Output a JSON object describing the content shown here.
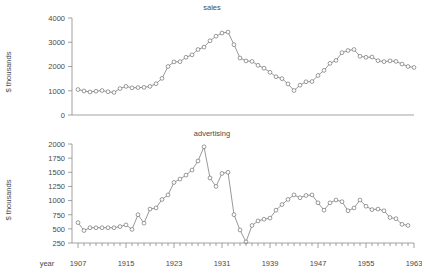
{
  "figure": {
    "background": "#ffffff",
    "line_color": "#6d6d6d",
    "marker_color": "#5a5a5a",
    "axis_color": "#8a8a8a",
    "text_color": "#4a4a4a"
  },
  "axis": {
    "x_axis_title": "year",
    "y_axis_label_top": "$ thousands",
    "y_axis_label_bottom": "$ thousands",
    "x_tick_labels": [
      "1907",
      "1915",
      "1923",
      "1931",
      "1939",
      "1947",
      "1955",
      "1963"
    ],
    "y_tick_labels_sales": [
      "0",
      "1000",
      "2000",
      "3000",
      "4000"
    ],
    "y_tick_labels_advertising": [
      "250",
      "500",
      "750",
      "1000",
      "1250",
      "1500",
      "1750",
      "2000"
    ]
  },
  "titles": {
    "top_panel": "sales",
    "bottom_panel": "advertising"
  },
  "chart_data": [
    {
      "type": "line",
      "title": "sales",
      "xlabel": "year",
      "ylabel": "$ thousands",
      "xlim": [
        1906,
        1963
      ],
      "ylim": [
        0,
        4000
      ],
      "ytick_values": [
        0,
        1000,
        2000,
        3000,
        4000
      ],
      "xtick_values": [
        1907,
        1915,
        1923,
        1931,
        1939,
        1947,
        1955,
        1963
      ],
      "grid": false,
      "legend": "none",
      "marker": "open-circle",
      "x": [
        1907,
        1908,
        1909,
        1910,
        1911,
        1912,
        1913,
        1914,
        1915,
        1916,
        1917,
        1918,
        1919,
        1920,
        1921,
        1922,
        1923,
        1924,
        1925,
        1926,
        1927,
        1928,
        1929,
        1930,
        1931,
        1932,
        1933,
        1934,
        1935,
        1936,
        1937,
        1938,
        1939,
        1940,
        1941,
        1942,
        1943,
        1944,
        1945,
        1946,
        1947,
        1948,
        1949,
        1950,
        1951,
        1952,
        1953,
        1954,
        1955,
        1956,
        1957,
        1958,
        1959,
        1960
      ],
      "values": [
        1050,
        990,
        950,
        980,
        1010,
        960,
        930,
        1090,
        1180,
        1120,
        1130,
        1140,
        1180,
        1290,
        1510,
        2000,
        2190,
        2200,
        2380,
        2480,
        2700,
        2800,
        3060,
        3250,
        3380,
        3420,
        2900,
        2350,
        2230,
        2210,
        2050,
        1930,
        1760,
        1580,
        1500,
        1280,
        1010,
        1230,
        1370,
        1380,
        1630,
        1840,
        2130,
        2250,
        2570,
        2660,
        2700,
        2420,
        2380,
        2390,
        2240,
        2200,
        2230,
        2210
      ],
      "secondary_x": [
        1961,
        1962,
        1963
      ],
      "secondary_values": [
        2100,
        2000,
        1960
      ]
    },
    {
      "type": "line",
      "title": "advertising",
      "xlabel": "year",
      "ylabel": "$ thousands",
      "xlim": [
        1906,
        1963
      ],
      "ylim": [
        250,
        2000
      ],
      "ytick_values": [
        250,
        500,
        750,
        1000,
        1250,
        1500,
        1750,
        2000
      ],
      "xtick_values": [
        1907,
        1915,
        1923,
        1931,
        1939,
        1947,
        1955,
        1963
      ],
      "grid": false,
      "legend": "none",
      "marker": "open-circle",
      "x": [
        1907,
        1908,
        1909,
        1910,
        1911,
        1912,
        1913,
        1914,
        1915,
        1916,
        1917,
        1918,
        1919,
        1920,
        1921,
        1922,
        1923,
        1924,
        1925,
        1926,
        1927,
        1928,
        1929,
        1930,
        1931,
        1932,
        1933,
        1934,
        1935,
        1936,
        1937,
        1938,
        1939,
        1940,
        1941,
        1942,
        1943,
        1944,
        1945,
        1946,
        1947,
        1948,
        1949,
        1950,
        1951,
        1952,
        1953,
        1954,
        1955,
        1956,
        1957,
        1958,
        1959,
        1960,
        1961,
        1962
      ],
      "values": [
        610,
        470,
        520,
        520,
        520,
        520,
        520,
        540,
        570,
        490,
        750,
        600,
        850,
        870,
        1020,
        1100,
        1320,
        1380,
        1450,
        1540,
        1700,
        1950,
        1400,
        1250,
        1480,
        1500,
        750,
        480,
        270,
        560,
        640,
        670,
        690,
        830,
        930,
        1020,
        1100,
        1050,
        1090,
        1100,
        960,
        830,
        960,
        1010,
        980,
        820,
        870,
        1010,
        900,
        840,
        850,
        820,
        700,
        680,
        580,
        560
      ]
    }
  ]
}
